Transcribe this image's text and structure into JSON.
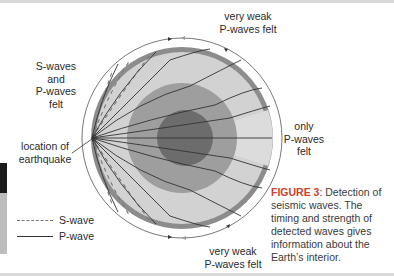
{
  "figure": {
    "labels": {
      "top": [
        "very weak",
        "P-waves felt"
      ],
      "upper_left": [
        "S-waves",
        "and",
        "P-waves",
        "felt"
      ],
      "right": [
        "only",
        "P-waves",
        "felt"
      ],
      "bottom": [
        "very weak",
        "P-waves felt"
      ],
      "epicenter": [
        "location of",
        "earthquake"
      ]
    },
    "legend": [
      {
        "label": "S-wave",
        "style": "dashed"
      },
      {
        "label": "P-wave",
        "style": "solid"
      }
    ],
    "caption": {
      "figure_number": "FIGURE 3",
      "text": ": Detection of seismic waves. The timing and strength of detected waves gives information about the Earth’s interior."
    },
    "colors": {
      "crust_rim": "#8c8c8c",
      "mantle": "#d2d2d2",
      "outer_core": "#9e9e9e",
      "inner_core": "#6c6c6c",
      "wave_line": "#333333",
      "s_wave": "#7a7a7a",
      "caption_accent": "#c9422d"
    }
  }
}
